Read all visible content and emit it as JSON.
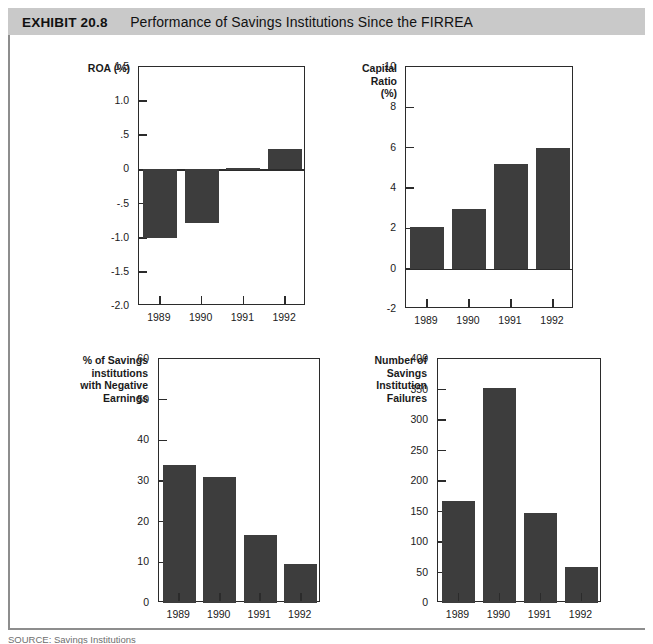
{
  "header": {
    "exhibit_number": "EXHIBIT 20.8",
    "title": "Performance of Savings Institutions Since the FIRREA",
    "band_color": "#c9c9c9"
  },
  "source": {
    "text": "SOURCE: Savings Institutions"
  },
  "style": {
    "bar_color": "#3d3d3d",
    "axis_color": "#2b2b2b",
    "page_background": "#ffffff"
  },
  "chart_data": [
    {
      "id": "roa",
      "type": "bar",
      "title": "",
      "ylabel": "ROA (%)",
      "xlabel": "",
      "categories": [
        "1989",
        "1990",
        "1991",
        "1992"
      ],
      "values": [
        -1.0,
        -0.78,
        0.02,
        0.3
      ],
      "ylim": [
        -2.0,
        1.5
      ],
      "yticks": [
        1.5,
        1.0,
        0.5,
        0,
        -0.5,
        -1.0,
        -1.5,
        -2.0
      ],
      "ytick_labels": [
        "1.5",
        "1.0",
        ".5",
        "0",
        "-.5",
        "-1.0",
        "-1.5",
        "-2.0"
      ],
      "grid": false,
      "legend": "none"
    },
    {
      "id": "capital-ratio",
      "type": "bar",
      "title": "",
      "ylabel": "Capital\nRatio\n(%)",
      "xlabel": "",
      "categories": [
        "1989",
        "1990",
        "1991",
        "1992"
      ],
      "values": [
        2.05,
        2.95,
        5.2,
        6.0
      ],
      "ylim": [
        -2,
        10
      ],
      "yticks": [
        10,
        8,
        6,
        4,
        2,
        0,
        -2
      ],
      "ytick_labels": [
        "10",
        "8",
        "6",
        "4",
        "2",
        "0",
        "-2"
      ],
      "grid": false,
      "legend": "none"
    },
    {
      "id": "negative-earnings",
      "type": "bar",
      "title": "",
      "ylabel": "% of Savings\ninstitutions\nwith Negative\nEarnings",
      "xlabel": "",
      "categories": [
        "1989",
        "1990",
        "1991",
        "1992"
      ],
      "values": [
        34,
        31,
        16.6,
        9.7
      ],
      "ylim": [
        0,
        60
      ],
      "yticks": [
        60,
        50,
        40,
        30,
        20,
        10,
        0
      ],
      "ytick_labels": [
        "60",
        "50",
        "40",
        "30",
        "20",
        "10",
        "0"
      ],
      "grid": false,
      "legend": "none"
    },
    {
      "id": "failures",
      "type": "bar",
      "title": "",
      "ylabel": "Number of\nSavings\nInstitution\nFailures",
      "xlabel": "",
      "categories": [
        "1989",
        "1990",
        "1991",
        "1992"
      ],
      "values": [
        167,
        353,
        147,
        59
      ],
      "ylim": [
        0,
        400
      ],
      "yticks": [
        400,
        350,
        300,
        250,
        200,
        150,
        100,
        50,
        0
      ],
      "ytick_labels": [
        "400",
        "350",
        "300",
        "250",
        "200",
        "150",
        "100",
        "50",
        "0"
      ],
      "grid": false,
      "legend": "none"
    }
  ]
}
